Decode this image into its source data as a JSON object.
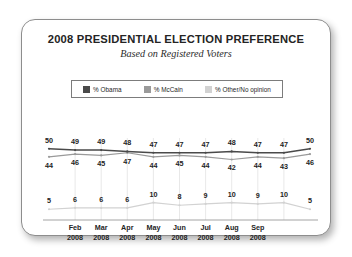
{
  "chart_data": {
    "type": "line",
    "title": "2008 PRESIDENTIAL ELECTION PREFERENCE",
    "subtitle": "Based on Registered Voters",
    "xlabel": "",
    "ylabel": "",
    "ylim": [
      0,
      55
    ],
    "grid": "vertical",
    "legend_position": "top-center",
    "x": [
      "Jan 2008",
      "Feb 2008",
      "Mar 2008",
      "Apr 2008",
      "May 2008",
      "Jun 2008",
      "Jul 2008",
      "Aug 2008",
      "Sep 2008",
      "Oct 2008",
      "Nov 2008"
    ],
    "tick_labels": [
      {
        "month": "Feb",
        "year": "2008"
      },
      {
        "month": "Mar",
        "year": "2008"
      },
      {
        "month": "Apr",
        "year": "2008"
      },
      {
        "month": "May",
        "year": "2008"
      },
      {
        "month": "Jun",
        "year": "2008"
      },
      {
        "month": "Jul",
        "year": "2008"
      },
      {
        "month": "Aug",
        "year": "2008"
      },
      {
        "month": "Sep",
        "year": "2008"
      }
    ],
    "series": [
      {
        "name": "% Obama",
        "color": "#4a4a4a",
        "values": [
          50,
          49,
          49,
          48,
          47,
          47,
          47,
          48,
          47,
          47,
          50
        ]
      },
      {
        "name": "% McCain",
        "color": "#9a9a9a",
        "values": [
          44,
          46,
          45,
          47,
          44,
          45,
          44,
          42,
          44,
          43,
          46
        ]
      },
      {
        "name": "% Other/No opinion",
        "color": "#d2d2d2",
        "values": [
          5,
          6,
          6,
          6,
          10,
          8,
          9,
          10,
          9,
          10,
          5
        ]
      }
    ]
  },
  "legend": {
    "items": [
      {
        "label": "% Obama",
        "color": "#4a4a4a"
      },
      {
        "label": "% McCain",
        "color": "#9a9a9a"
      },
      {
        "label": "% Other/No opinion",
        "color": "#d2d2d2"
      }
    ]
  }
}
